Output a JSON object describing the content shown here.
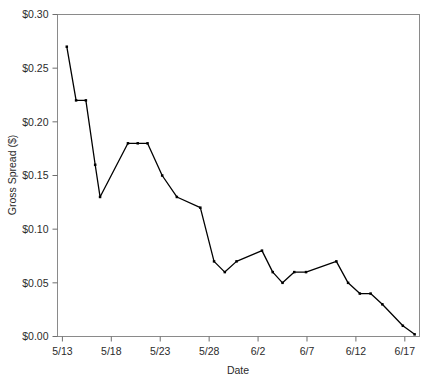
{
  "chart_data": {
    "type": "line",
    "title": "",
    "xlabel": "Date",
    "ylabel": "Gross Spread ($)",
    "ylim": [
      0.0,
      0.3
    ],
    "ytick_values": [
      0.0,
      0.05,
      0.1,
      0.15,
      0.2,
      0.25,
      0.3
    ],
    "ytick_labels": [
      "$0.00",
      "$0.05",
      "$0.10",
      "$0.15",
      "$0.20",
      "$0.25",
      "$0.30"
    ],
    "xtick_labels": [
      "5/13",
      "5/18",
      "5/23",
      "5/28",
      "6/2",
      "6/7",
      "6/12",
      "6/17"
    ],
    "xtick_values": [
      0,
      5,
      10,
      15,
      20,
      25,
      30,
      35
    ],
    "xlim": [
      -0.5,
      36.5
    ],
    "grid": false,
    "legend": null,
    "marker": "filled-square",
    "line_color": "#000000",
    "x": [
      0,
      1,
      2,
      3,
      4,
      5,
      6,
      7,
      8,
      9,
      10,
      11,
      12,
      13,
      14,
      15,
      16,
      17,
      18,
      19,
      20,
      21,
      22,
      23,
      24,
      25,
      26,
      27,
      28,
      29,
      30,
      31,
      32,
      33,
      34,
      35,
      36
    ],
    "categories": [
      "5/13",
      "5/14",
      "5/15",
      "5/16",
      "5/17",
      "5/18",
      "5/19",
      "5/20",
      "5/21",
      "5/22",
      "5/23",
      "5/24",
      "5/25",
      "5/26",
      "5/27",
      "5/28",
      "5/29",
      "5/30",
      "5/31",
      "6/1",
      "6/2",
      "6/3",
      "6/4",
      "6/5",
      "6/6",
      "6/7",
      "6/8",
      "6/9",
      "6/10",
      "6/11",
      "6/12",
      "6/13",
      "6/14",
      "6/15",
      "6/16",
      "6/17",
      "6/18"
    ],
    "values": [
      0.27,
      null,
      0.22,
      0.22,
      null,
      0.16,
      0.13,
      null,
      0.18,
      0.18,
      0.18,
      null,
      0.15,
      0.13,
      null,
      null,
      0.12,
      null,
      null,
      0.07,
      0.06,
      null,
      0.07,
      null,
      null,
      0.08,
      null,
      0.06,
      0.05,
      null,
      0.06,
      0.06,
      null,
      null,
      null,
      0.07,
      0.05
    ],
    "series": [
      {
        "name": "Gross Spread",
        "points": [
          {
            "x": 0.45,
            "y": 0.27,
            "label": "5/13"
          },
          {
            "x": 1.4,
            "y": 0.22,
            "label": "5/14"
          },
          {
            "x": 2.4,
            "y": 0.22,
            "label": "5/15"
          },
          {
            "x": 3.35,
            "y": 0.16,
            "label": "5/16"
          },
          {
            "x": 3.85,
            "y": 0.13,
            "label": "5/17"
          },
          {
            "x": 6.7,
            "y": 0.18,
            "label": "5/19"
          },
          {
            "x": 7.7,
            "y": 0.18,
            "label": "5/20"
          },
          {
            "x": 8.7,
            "y": 0.18,
            "label": "5/21"
          },
          {
            "x": 10.2,
            "y": 0.15,
            "label": "5/23"
          },
          {
            "x": 11.7,
            "y": 0.13,
            "label": "5/24"
          },
          {
            "x": 14.1,
            "y": 0.12,
            "label": "5/27"
          },
          {
            "x": 15.5,
            "y": 0.07,
            "label": "5/28"
          },
          {
            "x": 16.6,
            "y": 0.06,
            "label": "5/29"
          },
          {
            "x": 17.8,
            "y": 0.07,
            "label": "5/30"
          },
          {
            "x": 20.4,
            "y": 0.08,
            "label": "6/2"
          },
          {
            "x": 21.5,
            "y": 0.06,
            "label": "6/3"
          },
          {
            "x": 22.5,
            "y": 0.05,
            "label": "6/4"
          },
          {
            "x": 23.7,
            "y": 0.06,
            "label": "6/5"
          },
          {
            "x": 24.9,
            "y": 0.06,
            "label": "6/6"
          },
          {
            "x": 28.0,
            "y": 0.07,
            "label": "6/9"
          },
          {
            "x": 29.2,
            "y": 0.05,
            "label": "6/10"
          },
          {
            "x": 30.4,
            "y": 0.04,
            "label": "6/11"
          },
          {
            "x": 31.5,
            "y": 0.04,
            "label": "6/12"
          },
          {
            "x": 32.7,
            "y": 0.03,
            "label": "6/13"
          },
          {
            "x": 34.8,
            "y": 0.01,
            "label": "6/16"
          },
          {
            "x": 36.0,
            "y": 0.002,
            "label": "6/17"
          }
        ]
      }
    ]
  }
}
